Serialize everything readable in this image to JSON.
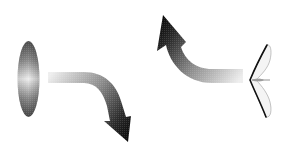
{
  "diagram": {
    "elements": [
      {
        "id": "disc-face-on",
        "shape": "ellipse",
        "shading": "grey-gradient"
      },
      {
        "id": "arrow-down-right",
        "direction": "right-then-down",
        "shading": "light-to-dark"
      },
      {
        "id": "arrow-up-left",
        "direction": "left-then-up",
        "shading": "light-to-dark"
      },
      {
        "id": "disc-edge-on",
        "shape": "chevron-profile",
        "shading": "outline"
      }
    ],
    "colors": {
      "background": "#ffffff",
      "dark": "#111111",
      "light": "#e6e6e6",
      "disc_edge": "#555555",
      "disc_center": "#eeeeee"
    }
  }
}
